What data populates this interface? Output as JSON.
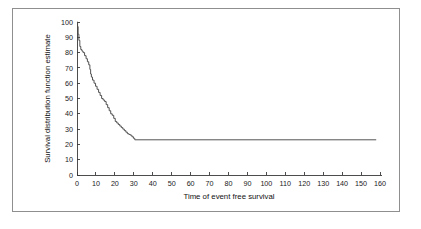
{
  "figure": {
    "background_color": "#ffffff",
    "border_color": "#8f8f8f",
    "curve_color": "#4a4a4a",
    "axis_color": "#3a3a3a"
  },
  "axes": {
    "x_title": "Time of event free survival",
    "y_title": "Survival distribution function estimate",
    "x_ticks": [
      "0",
      "10",
      "20",
      "30",
      "40",
      "50",
      "60",
      "70",
      "80",
      "90",
      "100",
      "110",
      "120",
      "130",
      "140",
      "150",
      "160"
    ],
    "y_ticks": [
      "0",
      "10",
      "20",
      "30",
      "40",
      "50",
      "60",
      "70",
      "80",
      "90",
      "100"
    ]
  },
  "chart_data": {
    "type": "line",
    "title": "",
    "subtitle": "",
    "xlabel": "Time of event free survival",
    "ylabel": "Survival distribution function estimate",
    "xlim": [
      0,
      160
    ],
    "ylim": [
      0,
      100
    ],
    "x_tick_values": [
      0,
      10,
      20,
      30,
      40,
      50,
      60,
      70,
      80,
      90,
      100,
      110,
      120,
      130,
      140,
      150,
      160
    ],
    "y_tick_values": [
      0,
      10,
      20,
      30,
      40,
      50,
      60,
      70,
      80,
      90,
      100
    ],
    "grid": false,
    "legend": false,
    "legend_position": "none",
    "step_style": "post",
    "annotations": [],
    "series": [
      {
        "name": "Survival distribution function estimate",
        "color": "#4a4a4a",
        "x": [
          0,
          0.3,
          0.6,
          1.0,
          1.5,
          2.0,
          2.6,
          3.2,
          4.0,
          4.8,
          5.5,
          6.2,
          6.8,
          7.2,
          7.6,
          8.2,
          9.0,
          9.8,
          10.6,
          11.4,
          12.2,
          13.0,
          13.8,
          14.6,
          15.4,
          16.2,
          17.0,
          17.8,
          18.6,
          19.4,
          20.2,
          21.0,
          21.8,
          22.6,
          23.4,
          24.2,
          25.0,
          25.8,
          26.6,
          27.4,
          28.2,
          29.0,
          29.8,
          30.5,
          158.0
        ],
        "y": [
          100,
          97,
          92,
          88,
          84,
          82,
          81,
          80,
          78,
          76,
          74,
          72,
          69,
          66,
          64,
          62,
          60,
          58,
          56,
          54,
          52,
          50,
          49,
          48,
          46,
          44,
          42,
          40,
          39,
          37,
          35,
          34,
          33,
          32,
          31,
          30,
          29,
          28,
          27,
          26.5,
          26,
          25,
          24,
          23,
          23
        ]
      }
    ],
    "plateau_value": 23,
    "plateau_start_time": 30.5,
    "curve_end_time": 158
  }
}
